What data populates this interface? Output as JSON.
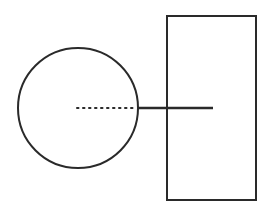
{
  "diagram": {
    "background": "#ffffff",
    "stroke_color": "#2a2a2a",
    "shapes": {
      "circle": {
        "cx": 78,
        "cy": 108,
        "r": 60,
        "stroke_width": 2
      },
      "rectangle": {
        "x": 167,
        "y": 16,
        "width": 89,
        "height": 184,
        "stroke_width": 2
      },
      "dotted_line": {
        "x1": 77,
        "y1": 108,
        "x2": 136,
        "y2": 108,
        "stroke_width": 2,
        "dash": "1.5,4.5"
      },
      "solid_line": {
        "x1": 138,
        "y1": 108,
        "x2": 213,
        "y2": 108,
        "stroke_width": 2.5
      }
    }
  }
}
